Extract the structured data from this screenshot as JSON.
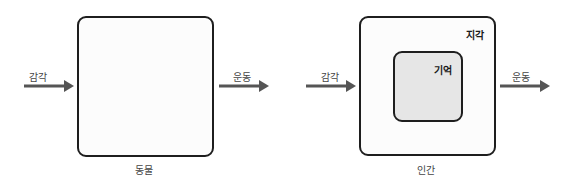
{
  "diagram": {
    "colors": {
      "stroke": "#1e1e1e",
      "arrow": "#555555",
      "box_fill": "#fcfcfc",
      "inner_fill": "#e6e6e6"
    },
    "left": {
      "input_label": "감각",
      "output_label": "운동",
      "caption": "동물"
    },
    "right": {
      "input_label": "감각",
      "output_label": "운동",
      "caption": "인간",
      "outer_label": "지각",
      "inner_label": "기억"
    }
  }
}
